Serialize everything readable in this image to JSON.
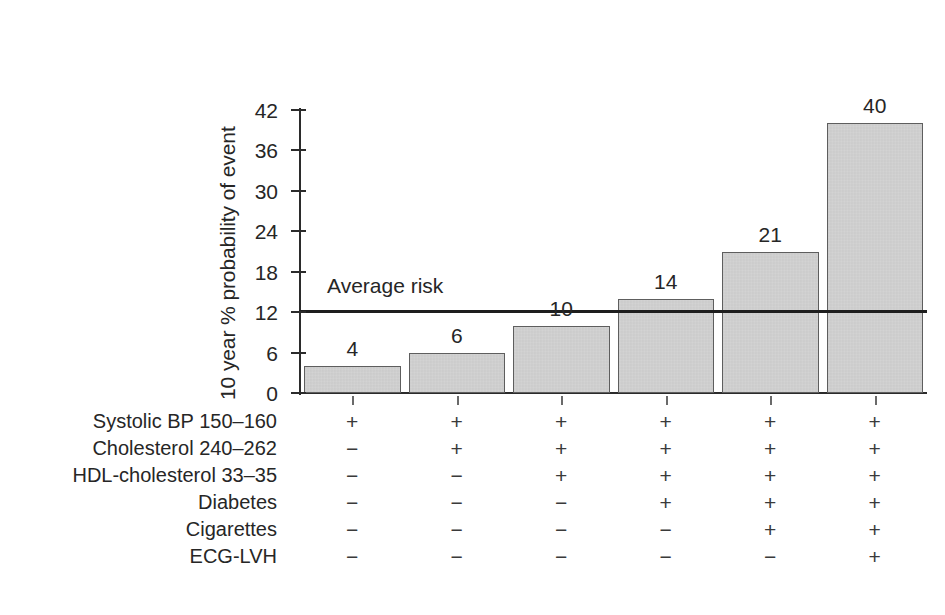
{
  "chart_data": {
    "type": "bar",
    "title": "",
    "subtitle": "",
    "xlabel": "",
    "ylabel": "10 year % probability of event",
    "ylim": [
      0,
      42
    ],
    "yticks": [
      0,
      6,
      12,
      18,
      24,
      30,
      36,
      42
    ],
    "ytick_labels": [
      "0",
      "6",
      "12",
      "18",
      "24",
      "30",
      "36",
      "42"
    ],
    "grid": false,
    "legend": "none",
    "categories": [
      "1",
      "2",
      "3",
      "4",
      "5",
      "6"
    ],
    "values": [
      4,
      6,
      10,
      14,
      21,
      40
    ],
    "value_labels": [
      "4",
      "6",
      "10",
      "14",
      "21",
      "40"
    ],
    "bar_color": "#d3d3d3",
    "bar_edge_color": "#5e5e5e",
    "annotations": [
      {
        "name": "average-risk",
        "label": "Average risk",
        "value": 12.2,
        "orientation": "horizontal",
        "color": "#1e1e1e"
      }
    ],
    "risk_factor_table": {
      "rows": [
        {
          "label": "Systolic BP 150–160",
          "marks": [
            "+",
            "+",
            "+",
            "+",
            "+",
            "+"
          ]
        },
        {
          "label": "Cholesterol 240–262",
          "marks": [
            "−",
            "+",
            "+",
            "+",
            "+",
            "+"
          ]
        },
        {
          "label": "HDL-cholesterol 33–35",
          "marks": [
            "−",
            "−",
            "+",
            "+",
            "+",
            "+"
          ]
        },
        {
          "label": "Diabetes",
          "marks": [
            "−",
            "−",
            "−",
            "+",
            "+",
            "+"
          ]
        },
        {
          "label": "Cigarettes",
          "marks": [
            "−",
            "−",
            "−",
            "−",
            "+",
            "+"
          ]
        },
        {
          "label": "ECG-LVH",
          "marks": [
            "−",
            "−",
            "−",
            "−",
            "−",
            "+"
          ]
        }
      ]
    }
  },
  "axis": {
    "y_title": "10 year % probability of event"
  },
  "colors": {
    "background": "#ffffff",
    "ink": "#262626",
    "bar_fill": "#d3d3d3",
    "bar_edge": "#5e5e5e",
    "average_line": "#1e1e1e"
  }
}
